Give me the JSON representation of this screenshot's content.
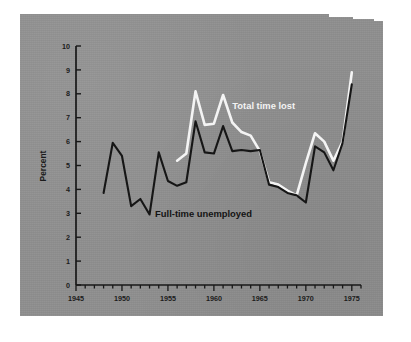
{
  "figure": {
    "background_color": "#ffffff",
    "photo_color": "#8f8f8f",
    "ink_color": "#161616",
    "highlight_color": "#f4f4f4"
  },
  "axes": {
    "y_label": "Percent",
    "y_ticks": [
      "0",
      "1",
      "2",
      "3",
      "4",
      "5",
      "6",
      "7",
      "8",
      "9",
      "10"
    ],
    "x_ticks_major": [
      "1945",
      "1950",
      "1955",
      "1960",
      "1965",
      "1970",
      "1975"
    ]
  },
  "series_labels": {
    "total": "Total time lost",
    "unemployed": "Full-time unemployed"
  },
  "chart_data": {
    "type": "line",
    "title": "",
    "subtitle": "",
    "xlabel": "",
    "ylabel": "Percent",
    "xlim": [
      1945,
      1976
    ],
    "ylim": [
      0,
      10
    ],
    "grid": false,
    "legend": "inline-annotations",
    "x_tick_labels": [
      "1945",
      "1950",
      "1955",
      "1960",
      "1965",
      "1970",
      "1975"
    ],
    "y_tick_labels": [
      "0",
      "1",
      "2",
      "3",
      "4",
      "5",
      "6",
      "7",
      "8",
      "9",
      "10"
    ],
    "annotations": [
      {
        "text": "Total time lost",
        "x": 1962.0,
        "y": 7.35,
        "color": "#f4f4f4"
      },
      {
        "text": "Full-time unemployed",
        "x": 1953.6,
        "y": 2.85,
        "color": "#141414"
      }
    ],
    "series": [
      {
        "name": "Total time lost",
        "color": "#f4f4f4",
        "x": [
          1956,
          1957,
          1958,
          1959,
          1960,
          1961,
          1962,
          1963,
          1964,
          1965,
          1966,
          1967,
          1968,
          1969,
          1970,
          1971,
          1972,
          1973,
          1974,
          1975
        ],
        "values": [
          5.2,
          5.5,
          8.1,
          6.7,
          6.75,
          7.95,
          6.8,
          6.4,
          6.25,
          5.6,
          4.3,
          4.2,
          3.95,
          3.75,
          5.1,
          6.35,
          6.0,
          5.2,
          6.0,
          8.9
        ]
      },
      {
        "name": "Full-time unemployed",
        "color": "#161616",
        "x": [
          1948,
          1949,
          1950,
          1951,
          1952,
          1953,
          1954,
          1955,
          1956,
          1957,
          1958,
          1959,
          1960,
          1961,
          1962,
          1963,
          1964,
          1965,
          1966,
          1967,
          1968,
          1969,
          1970,
          1971,
          1972,
          1973,
          1974,
          1975
        ],
        "values": [
          3.85,
          5.95,
          5.4,
          3.3,
          3.6,
          2.95,
          5.55,
          4.35,
          4.15,
          4.3,
          6.85,
          5.55,
          5.5,
          6.65,
          5.6,
          5.65,
          5.6,
          5.65,
          4.2,
          4.1,
          3.85,
          3.75,
          3.45,
          5.8,
          5.55,
          4.8,
          5.95,
          8.4
        ]
      }
    ]
  }
}
